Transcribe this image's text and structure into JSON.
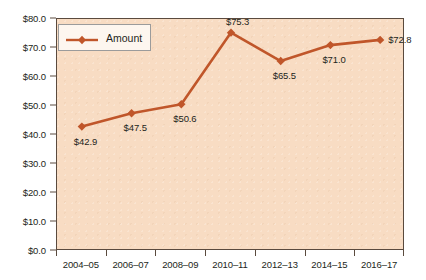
{
  "chart_data": {
    "type": "line",
    "title": "",
    "xlabel": "",
    "ylabel": "",
    "categories": [
      "2004–05",
      "2006–07",
      "2008–09",
      "2010–11",
      "2012–13",
      "2014–15",
      "2016–17"
    ],
    "values": [
      42.9,
      47.5,
      50.6,
      75.3,
      65.5,
      71.0,
      72.8
    ],
    "point_labels": [
      "$42.9",
      "$47.5",
      "$50.6",
      "$75.3",
      "$65.5",
      "$71.0",
      "$72.8"
    ],
    "label_positions": [
      "below",
      "below",
      "below",
      "above",
      "below",
      "below",
      "right"
    ],
    "series": [
      {
        "name": "Amount",
        "values": [
          42.9,
          47.5,
          50.6,
          75.3,
          65.5,
          71.0,
          72.8
        ]
      }
    ],
    "ylim": [
      0.0,
      80.0
    ],
    "ytick_values": [
      0.0,
      10.0,
      20.0,
      30.0,
      40.0,
      50.0,
      60.0,
      70.0,
      80.0
    ],
    "ytick_labels": [
      "$0.0",
      "$10.0",
      "$20.0",
      "$30.0",
      "$40.0",
      "$50.0",
      "$60.0",
      "$70.0",
      "$80.0"
    ],
    "grid": false,
    "legend_position": "top-left-inside",
    "marker": "diamond",
    "colors": {
      "series_line": "#c0562a",
      "marker": "#c0562a",
      "plot_background": "#f8dcc3",
      "page_background": "#ffffff",
      "axis_line": "#5a4a3e",
      "text": "#231f20",
      "legend_background": "#fdf6ef",
      "legend_border": "#9b9b9b"
    }
  },
  "legend": {
    "entries": [
      {
        "label": "Amount"
      }
    ]
  }
}
